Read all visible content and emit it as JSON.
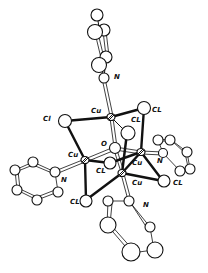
{
  "figure": {
    "labels": {
      "cu_top": "Cu",
      "cu_left": "Cu",
      "cu_right": "Cu",
      "cu_bottom": "Cu",
      "o_center": "O",
      "cl_left": "Cl",
      "cl_top_right": "CL",
      "cl_top_mid": "CL",
      "cl_center": "CL",
      "cl_bottom_left": "CL",
      "cl_bottom_right": "CL",
      "n_top": "N",
      "n_left": "N",
      "n_right": "N",
      "n_bottom": "N"
    },
    "colors": {
      "background": "#ffffff",
      "ink": "#111111"
    }
  }
}
